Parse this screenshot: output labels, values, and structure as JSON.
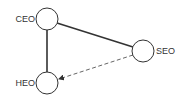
{
  "diagram": {
    "type": "network",
    "nodes": [
      {
        "id": "ceo",
        "label": "CEO",
        "cx": 47,
        "cy": 19,
        "r": 11,
        "label_side": "left"
      },
      {
        "id": "heo",
        "label": "HEO",
        "cx": 47,
        "cy": 83,
        "r": 11,
        "label_side": "left"
      },
      {
        "id": "seo",
        "label": "SEO",
        "cx": 143,
        "cy": 51,
        "r": 11,
        "label_side": "right"
      }
    ],
    "edges": [
      {
        "from": "CEO",
        "to": "HEO",
        "style": "solid",
        "directed": false
      },
      {
        "from": "CEO",
        "to": "SEO",
        "style": "solid",
        "directed": false
      },
      {
        "from": "SEO",
        "to": "HEO",
        "style": "dashed",
        "directed": true
      }
    ],
    "colors": {
      "stroke": "#333333",
      "dashed_stroke": "#555555",
      "node_fill": "#ffffff",
      "background": "#ffffff"
    }
  }
}
